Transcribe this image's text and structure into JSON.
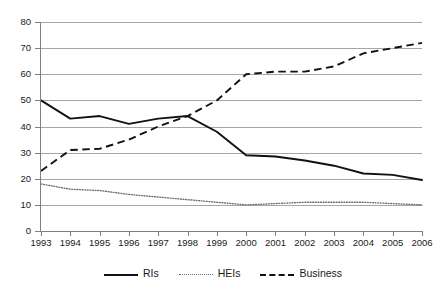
{
  "chart_data": {
    "type": "line",
    "title": "",
    "subtitle": "",
    "xlabel": "",
    "ylabel": "",
    "categories": [
      "1993",
      "1994",
      "1995",
      "1996",
      "1997",
      "1998",
      "1999",
      "2000",
      "2001",
      "2002",
      "2003",
      "2004",
      "2005",
      "2006"
    ],
    "x": [
      1993,
      1994,
      1995,
      1996,
      1997,
      1998,
      1999,
      2000,
      2001,
      2002,
      2003,
      2004,
      2005,
      2006
    ],
    "ylim": [
      0,
      80
    ],
    "ytick_step": 10,
    "yticks": [
      "0",
      "10",
      "20",
      "30",
      "40",
      "50",
      "60",
      "70",
      "80"
    ],
    "grid": "horizontal",
    "legend_position": "bottom-center",
    "series": [
      {
        "name": "RIs",
        "style": "solid",
        "color": "#111111",
        "values": [
          50,
          43,
          44,
          41,
          43,
          44,
          38,
          29,
          28.5,
          27,
          25,
          22,
          21.5,
          19.5
        ]
      },
      {
        "name": "HEIs",
        "style": "dotted",
        "color": "#6b6b6b",
        "values": [
          18,
          16,
          15.5,
          14,
          13,
          12,
          11,
          10,
          10.5,
          11,
          11,
          11,
          10.5,
          10
        ]
      },
      {
        "name": "Business",
        "style": "dashed",
        "color": "#111111",
        "values": [
          23,
          31,
          31.5,
          35,
          40,
          44,
          50,
          60,
          61,
          61,
          63,
          68,
          70,
          72
        ]
      }
    ]
  },
  "legend": {
    "items": [
      {
        "label": "RIs"
      },
      {
        "label": "HEIs"
      },
      {
        "label": "Business"
      }
    ]
  }
}
